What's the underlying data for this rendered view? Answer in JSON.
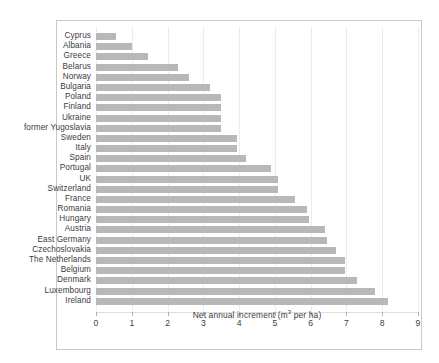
{
  "chart_data": {
    "type": "bar",
    "orientation": "horizontal",
    "title": "",
    "subtitle": "",
    "xlabel": "Net annual increment (m3 per ha)",
    "xlabel_prefix": "Net annual increment (m",
    "xlabel_sup": "3",
    "xlabel_suffix": " per ha)",
    "ylabel": "",
    "xlim": [
      0,
      9
    ],
    "xticks": [
      0,
      1,
      2,
      3,
      4,
      5,
      6,
      7,
      8,
      9
    ],
    "xtick_labels": [
      "0",
      "1",
      "2",
      "3",
      "4",
      "5",
      "6",
      "7",
      "8",
      "9"
    ],
    "grid": "vertical-only",
    "legend": "none",
    "bar_color": "#b6b8ba",
    "gridline_color": "#ececed",
    "frame_color": "#c9c9c9",
    "text_color": "#3b3b3d",
    "categories": [
      "Cyprus",
      "Albania",
      "Greece",
      "Belarus",
      "Norway",
      "Bulgaria",
      "Poland",
      "Finland",
      "Ukraine",
      "former Yugoslavia",
      "Sweden",
      "Italy",
      "Spain",
      "Portugal",
      "UK",
      "Switzerland",
      "France",
      "Romania",
      "Hungary",
      "Austria",
      "East Germany",
      "Czechoslovakia",
      "The Netherlands",
      "Belgium",
      "Denmark",
      "Luxembourg",
      "Ireland"
    ],
    "values": [
      0.55,
      1.0,
      1.45,
      2.3,
      2.6,
      3.2,
      3.5,
      3.5,
      3.5,
      3.5,
      3.95,
      3.95,
      4.2,
      4.9,
      5.1,
      5.1,
      5.55,
      5.9,
      5.95,
      6.4,
      6.45,
      6.7,
      6.95,
      6.95,
      7.3,
      7.8,
      8.15
    ]
  }
}
